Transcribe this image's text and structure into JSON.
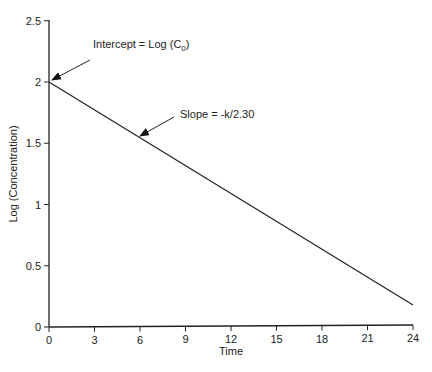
{
  "chart_data": {
    "type": "line",
    "title": "",
    "xlabel": "Time",
    "ylabel": "Log (Concentration)",
    "xlim": [
      0,
      24
    ],
    "ylim": [
      0,
      2.5
    ],
    "x_ticks": [
      "0",
      "3",
      "6",
      "9",
      "12",
      "15",
      "18",
      "21",
      "24"
    ],
    "y_ticks": [
      "0",
      "0.5",
      "1",
      "1.5",
      "2",
      "2.5"
    ],
    "grid": false,
    "legend": null,
    "series": [
      {
        "name": "Log concentration",
        "x": [
          0,
          24
        ],
        "values": [
          2.0,
          0.18
        ]
      }
    ],
    "annotations": [
      {
        "text_main": "Intercept = Log (C",
        "text_sub": "0",
        "text_end": ")",
        "points_to": [
          0,
          2.0
        ]
      },
      {
        "text": "Slope = -k/2.30",
        "points_to": [
          6,
          1.55
        ]
      }
    ]
  }
}
